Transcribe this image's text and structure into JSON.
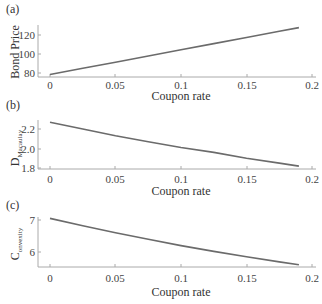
{
  "chart_data": [
    {
      "panel": "(a)",
      "type": "line",
      "title": "",
      "xlabel": "Coupon rate",
      "ylabel": "Bond Price",
      "x_ticks": [
        "0",
        "0.05",
        "0.1",
        "0.15",
        "0.2"
      ],
      "y_ticks": [
        "80",
        "100",
        "120"
      ],
      "xlim": [
        0,
        0.2
      ],
      "ylim": [
        77,
        131
      ],
      "grid": false,
      "series": [
        {
          "name": "Bond Price",
          "x": [
            0,
            0.025,
            0.05,
            0.075,
            0.1,
            0.125,
            0.15,
            0.175,
            0.19
          ],
          "values": [
            78.4,
            84.9,
            91.4,
            97.9,
            104.4,
            110.9,
            117.4,
            123.9,
            127.8
          ]
        }
      ]
    },
    {
      "panel": "(b)",
      "type": "line",
      "title": "",
      "xlabel": "Coupon rate",
      "ylabel": "D_Macaulay",
      "ylabel_main": "D",
      "ylabel_sub": "Macaulay",
      "x_ticks": [
        "0",
        "0.05",
        "0.1",
        "0.15",
        "0.2"
      ],
      "y_ticks": [
        "1.8",
        "2.0",
        "2.2"
      ],
      "xlim": [
        0,
        0.2
      ],
      "ylim": [
        1.79,
        2.3
      ],
      "grid": false,
      "series": [
        {
          "name": "Macaulay Duration",
          "x": [
            0,
            0.025,
            0.05,
            0.075,
            0.1,
            0.125,
            0.15,
            0.175,
            0.19
          ],
          "values": [
            2.27,
            2.2,
            2.13,
            2.07,
            2.01,
            1.96,
            1.9,
            1.85,
            1.82
          ]
        }
      ]
    },
    {
      "panel": "(c)",
      "type": "line",
      "title": "",
      "xlabel": "Coupon rate",
      "ylabel": "C_onvexity",
      "ylabel_main": "C",
      "ylabel_sub": "onvexity",
      "x_ticks": [
        "0",
        "0.05",
        "0.1",
        "0.15",
        "0.2"
      ],
      "y_ticks": [
        "6",
        "7"
      ],
      "xlim": [
        0,
        0.2
      ],
      "ylim": [
        5.5,
        7.15
      ],
      "grid": false,
      "series": [
        {
          "name": "Convexity",
          "x": [
            0,
            0.025,
            0.05,
            0.075,
            0.1,
            0.125,
            0.15,
            0.175,
            0.19
          ],
          "values": [
            7.05,
            6.82,
            6.6,
            6.4,
            6.2,
            6.02,
            5.85,
            5.69,
            5.6
          ]
        }
      ]
    }
  ],
  "panels": {
    "a": {
      "label": "(a)",
      "xlabel": "Coupon rate",
      "ylabel": "Bond Price"
    },
    "b": {
      "label": "(b)",
      "xlabel": "Coupon rate",
      "ylabel_main": "D",
      "ylabel_sub": "Macaulay"
    },
    "c": {
      "label": "(c)",
      "xlabel": "Coupon rate",
      "ylabel_main": "C",
      "ylabel_sub": "onvexity"
    }
  }
}
